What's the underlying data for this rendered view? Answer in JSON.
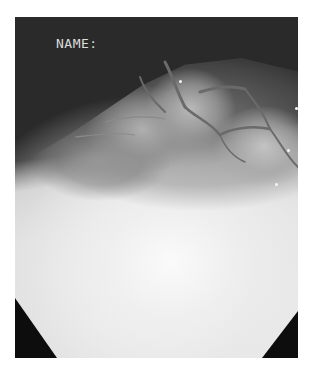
{
  "image": {
    "type": "endoscopic-photograph",
    "colormode": "grayscale",
    "overlay_text": "NAME:",
    "colors": {
      "background": "#ffffff",
      "dark_field": "#2a2a2a",
      "corner_mask": "#0d0d0d",
      "overlay_text": "#dcdcdc"
    }
  }
}
